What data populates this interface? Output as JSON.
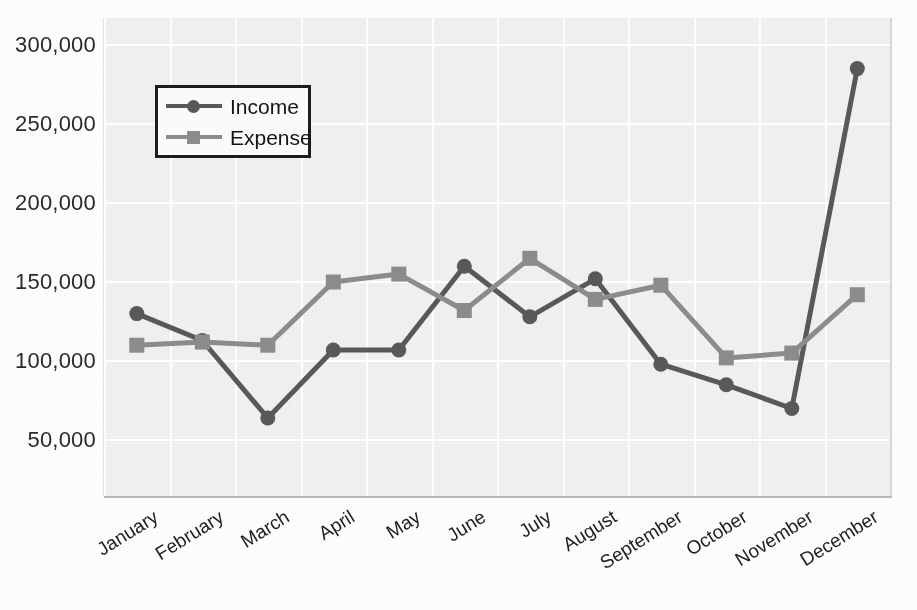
{
  "chart_data": {
    "type": "line",
    "title": "",
    "xlabel": "",
    "ylabel": "",
    "categories": [
      "January",
      "February",
      "March",
      "April",
      "May",
      "June",
      "July",
      "August",
      "September",
      "October",
      "November",
      "December"
    ],
    "series": [
      {
        "name": "Income",
        "color": "#595959",
        "marker": "circle",
        "values": [
          130000,
          113000,
          64000,
          107000,
          107000,
          160000,
          128000,
          152000,
          98000,
          85000,
          70000,
          285000
        ]
      },
      {
        "name": "Expense",
        "color": "#8c8c8c",
        "marker": "square",
        "values": [
          110000,
          112000,
          110000,
          150000,
          155000,
          132000,
          165000,
          139000,
          148000,
          102000,
          105000,
          142000
        ]
      }
    ],
    "yticks": [
      300000,
      250000,
      200000,
      150000,
      100000,
      50000
    ],
    "ytick_labels": [
      "300,000",
      "250,000",
      "200,000",
      "150,000",
      "100,000",
      "50,000"
    ],
    "ylim": [
      14000,
      317000
    ],
    "grid": true,
    "grid_color": "#ffffff",
    "plot_background": "#f0f0f0",
    "legend": {
      "position": "upper-left",
      "entries": [
        {
          "label": "Income",
          "color": "#595959",
          "marker": "circle"
        },
        {
          "label": "Expense",
          "color": "#8c8c8c",
          "marker": "square"
        }
      ]
    }
  }
}
